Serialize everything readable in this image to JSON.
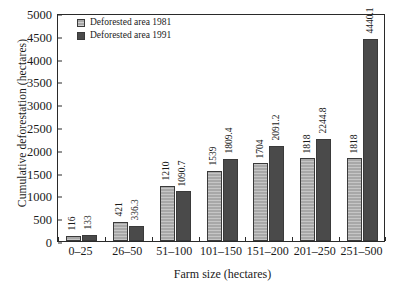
{
  "chart_data": {
    "type": "bar",
    "title": "",
    "xlabel": "Farm size (hectares)",
    "ylabel": "Cumulative deforestation (hectares)",
    "categories": [
      "0–25",
      "26–50",
      "51–100",
      "101–150",
      "151–200",
      "201–250",
      "251–500"
    ],
    "series": [
      {
        "name": "Deforested area 1981",
        "color": "#a8a8a8",
        "values": [
          116,
          421,
          1210,
          1539,
          1704,
          1818,
          1818
        ],
        "labels": [
          "116",
          "421",
          "1210",
          "1539",
          "1704",
          "1818",
          "1818"
        ]
      },
      {
        "name": "Deforested area 1991",
        "color": "#4a4a4a",
        "values": [
          133,
          336.3,
          1090.7,
          1809.4,
          2091.2,
          2244.8,
          4440.1
        ],
        "labels": [
          "133",
          "336.3",
          "1090.7",
          "1809.4",
          "2091.2",
          "2244.8",
          "4440.1"
        ]
      }
    ],
    "ylim": [
      0,
      5000
    ],
    "yticks": [
      0,
      500,
      1000,
      1500,
      2000,
      2500,
      3000,
      3500,
      4000,
      4500,
      5000
    ],
    "ytick_labels": [
      "0",
      "500",
      "1000",
      "1500",
      "2000",
      "2500",
      "3000",
      "3500",
      "4000",
      "4500",
      "5000"
    ],
    "grid": false,
    "legend_position": "top-left"
  }
}
